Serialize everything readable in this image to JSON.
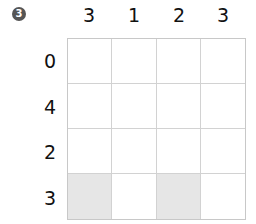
{
  "puzzle": {
    "number_badge": "3",
    "column_clues": [
      "3",
      "1",
      "2",
      "3"
    ],
    "row_clues": [
      "0",
      "4",
      "2",
      "3"
    ],
    "grid": [
      [
        0,
        0,
        0,
        0
      ],
      [
        0,
        0,
        0,
        0
      ],
      [
        0,
        0,
        0,
        0
      ],
      [
        1,
        0,
        1,
        0
      ]
    ],
    "colors": {
      "filled": "#e6e6e6",
      "empty": "#ffffff",
      "line": "#d2d2d2",
      "badge": "#555555"
    }
  }
}
